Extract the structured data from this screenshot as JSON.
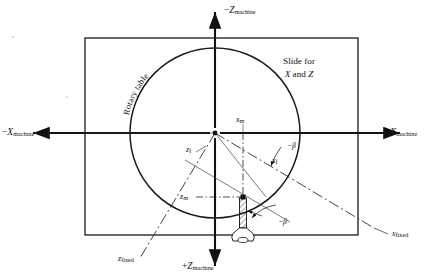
{
  "figure": {
    "background": "#ffffff",
    "line_color": "#1a1a1a",
    "width": 436,
    "height": 280
  },
  "axes": {
    "machine": {
      "negative_z": {
        "sign": "−",
        "letter": "Z",
        "subscript": "machine"
      },
      "positive_z": {
        "sign": "+",
        "letter": "Z",
        "subscript": "machine"
      },
      "negative_x": {
        "sign": "−",
        "letter": "X",
        "subscript": "machine"
      },
      "positive_x": {
        "sign": "+",
        "letter": "X",
        "subscript": "machine"
      }
    },
    "fixed": {
      "x_fixed": {
        "letter": "x",
        "subscript": "fixed"
      },
      "z_fixed": {
        "letter": "z",
        "subscript": "fixed"
      }
    }
  },
  "components": {
    "rotary_table": "Rotary table",
    "slide_line1": "Slide for",
    "slide_line2_prefix": "X",
    "slide_line2_mid": " and ",
    "slide_line2_suffix": "Z"
  },
  "dimensions": {
    "x_m": {
      "letter": "x",
      "subscript": "m"
    },
    "z_m": {
      "letter": "z",
      "subscript": "m"
    },
    "x_f": {
      "letter": "x",
      "subscript": "f"
    },
    "z_f": {
      "letter": "z",
      "subscript": "f"
    }
  },
  "angles": {
    "beta_upper": "−β",
    "beta_lower": "−β",
    "rotation_deg": -25
  },
  "geometry": {
    "rect": {
      "x": 85,
      "y": 38,
      "width": 273,
      "height": 197
    },
    "circle": {
      "cx": 215,
      "cy": 133,
      "r": 85
    },
    "origin": {
      "x": 215,
      "y": 133
    },
    "tool_point": {
      "x": 243,
      "y": 197
    },
    "tool": {
      "shank_x": 240,
      "shank_top": 198,
      "shank_bottom": 228,
      "shank_width": 7
    }
  }
}
